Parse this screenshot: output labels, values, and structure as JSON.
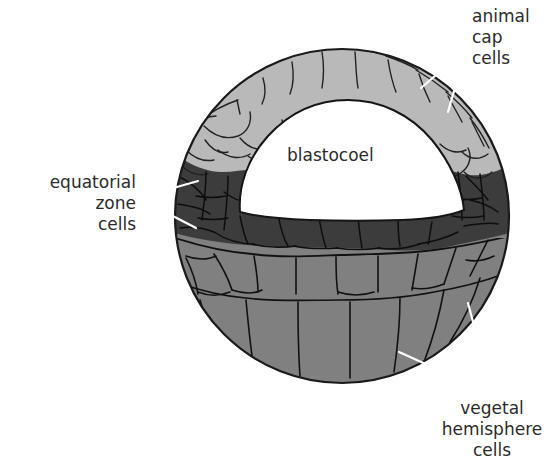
{
  "figure": {
    "background_color": "#ffffff",
    "outline_color": "#1a1a1a",
    "cavity_color": "#ffffff",
    "leader_line_color": "#ffffff",
    "text_color": "#2b2b2b"
  },
  "zones": {
    "animal_cap": {
      "name": "animal cap",
      "fill": "#b9b9b9",
      "description": "small rounded cells, several layers, top of embryo"
    },
    "equatorial_zone": {
      "name": "equatorial zone",
      "fill": "#3c3c3c",
      "description": "dark band of cells around the middle, beneath the blastocoel"
    },
    "vegetal_hemisphere": {
      "name": "vegetal hemisphere",
      "fill": "#808080",
      "description": "large wedge-shaped yolky cells, bottom of embryo"
    },
    "blastocoel": {
      "name": "blastocoel",
      "fill": "#ffffff",
      "description": "fluid-filled cavity, dome shaped with flat floor"
    }
  },
  "labels": {
    "animal_cap": "animal\ncap\ncells",
    "equatorial_zone": "equatorial\nzone\ncells",
    "vegetal_hemisphere": "vegetal\nhemisphere\ncells",
    "blastocoel": "blastocoel"
  }
}
